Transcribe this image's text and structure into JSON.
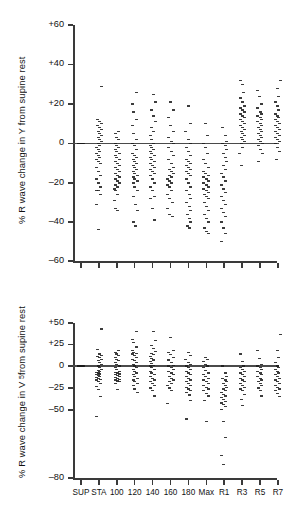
{
  "figure": {
    "title": "",
    "background": "#ffffff",
    "point_color": "#1a1a1a",
    "axis_color": "#3a3a3a"
  },
  "chart_data": [
    {
      "type": "scatter",
      "panel": "top",
      "title": "",
      "xlabel": "",
      "ylabel": "% R wave change in Y from supine rest",
      "ylabel_text": "% R wave change in Y from supine rest",
      "grid": false,
      "legend": "none",
      "ylim": [
        -60,
        60
      ],
      "yticks": [
        60,
        40,
        20,
        0,
        -20,
        -40,
        -60
      ],
      "ytick_labels": [
        "+60",
        "+40",
        "+20",
        "0",
        "–20",
        "–40",
        "–60"
      ],
      "categories": [
        "SUP",
        "STA",
        "100",
        "120",
        "140",
        "160",
        "180",
        "Max",
        "R1",
        "R3",
        "R5",
        "R7"
      ],
      "zero_reference_line": 0,
      "series": [
        {
          "name": "SUP",
          "values": [
            0,
            0,
            0,
            0,
            0,
            0,
            0,
            0,
            0,
            0,
            0,
            0,
            0,
            0,
            0,
            0,
            0,
            0,
            0,
            0,
            0,
            0,
            0,
            0,
            0,
            0,
            0,
            0,
            0,
            0
          ]
        },
        {
          "name": "STA",
          "values": [
            29,
            12,
            11,
            10,
            9,
            8,
            7,
            6,
            5,
            4,
            3,
            2,
            1,
            0,
            -1,
            -2,
            -3,
            -4,
            -5,
            -6,
            -7,
            -8,
            -9,
            -10,
            -12,
            -14,
            -16,
            -18,
            -20,
            -22,
            -24,
            -24,
            -26,
            -31,
            -44
          ]
        },
        {
          "name": "100",
          "values": [
            6,
            5,
            3,
            2,
            0,
            -1,
            -2,
            -3,
            -4,
            -5,
            -6,
            -7,
            -8,
            -9,
            -10,
            -11,
            -12,
            -13,
            -14,
            -15,
            -16,
            -17,
            -18,
            -19,
            -20,
            -21,
            -22,
            -23,
            -24,
            -26,
            -29,
            -33,
            -34
          ]
        },
        {
          "name": "120",
          "values": [
            26,
            20,
            16,
            12,
            9,
            5,
            2,
            0,
            -1,
            -3,
            -5,
            -6,
            -7,
            -8,
            -9,
            -10,
            -11,
            -12,
            -13,
            -14,
            -15,
            -16,
            -17,
            -18,
            -19,
            -20,
            -22,
            -24,
            -27,
            -31,
            -34,
            -40,
            -42
          ]
        },
        {
          "name": "140",
          "values": [
            25,
            21,
            17,
            14,
            11,
            8,
            6,
            4,
            2,
            0,
            -1,
            -2,
            -3,
            -4,
            -5,
            -6,
            -7,
            -8,
            -9,
            -10,
            -11,
            -12,
            -13,
            -14,
            -15,
            -16,
            -18,
            -20,
            -22,
            -24,
            -27,
            -28,
            -33,
            -39
          ]
        },
        {
          "name": "160",
          "values": [
            21,
            17,
            13,
            9,
            6,
            3,
            1,
            0,
            -2,
            -4,
            -6,
            -8,
            -10,
            -12,
            -13,
            -14,
            -15,
            -16,
            -17,
            -18,
            -19,
            -20,
            -21,
            -22,
            -24,
            -26,
            -28,
            -30,
            -33,
            -36,
            -37
          ]
        },
        {
          "name": "180",
          "values": [
            19,
            10,
            6,
            2,
            0,
            -2,
            -4,
            -6,
            -8,
            -9,
            -10,
            -11,
            -12,
            -13,
            -14,
            -15,
            -16,
            -18,
            -20,
            -22,
            -24,
            -26,
            -28,
            -30,
            -32,
            -34,
            -36,
            -38,
            -40,
            -42,
            -43
          ]
        },
        {
          "name": "Max",
          "values": [
            10,
            4,
            0,
            -2,
            -5,
            -8,
            -10,
            -12,
            -14,
            -15,
            -16,
            -17,
            -18,
            -19,
            -20,
            -21,
            -22,
            -23,
            -24,
            -25,
            -26,
            -27,
            -28,
            -30,
            -32,
            -34,
            -36,
            -38,
            -40,
            -43,
            -45,
            -46
          ]
        },
        {
          "name": "R1",
          "values": [
            8,
            4,
            1,
            0,
            -1,
            -3,
            -5,
            -7,
            -9,
            -11,
            -13,
            -15,
            -17,
            -19,
            -21,
            -23,
            -25,
            -27,
            -29,
            -31,
            -33,
            -35,
            -37,
            -40,
            -43,
            -46,
            -50
          ]
        },
        {
          "name": "R3",
          "values": [
            32,
            30,
            26,
            23,
            21,
            19,
            18,
            17,
            16,
            15,
            14,
            13,
            12,
            11,
            10,
            9,
            8,
            7,
            6,
            5,
            4,
            3,
            2,
            1,
            0,
            -2,
            -5,
            -11
          ]
        },
        {
          "name": "R5",
          "values": [
            27,
            24,
            20,
            18,
            16,
            15,
            14,
            13,
            12,
            11,
            10,
            9,
            8,
            7,
            6,
            5,
            4,
            3,
            2,
            1,
            0,
            -1,
            -3,
            -5,
            -9
          ]
        },
        {
          "name": "R7",
          "values": [
            32,
            28,
            24,
            21,
            19,
            17,
            15,
            14,
            13,
            12,
            11,
            10,
            9,
            8,
            7,
            6,
            5,
            4,
            3,
            2,
            1,
            0,
            -2,
            -4,
            -8
          ]
        }
      ]
    },
    {
      "type": "scatter",
      "panel": "bottom",
      "title": "",
      "xlabel": "",
      "ylabel": "% R wave change in V5 from supine rest",
      "ylabel_prefix": "% R wave change in V",
      "ylabel_subscript": "5",
      "ylabel_suffix": " from supine rest",
      "grid": false,
      "legend": "none",
      "ylim": [
        -80,
        50
      ],
      "yticks": [
        50,
        25,
        0,
        -25,
        -50,
        -80
      ],
      "ytick_labels": [
        "+50",
        "+25",
        "0",
        "–25",
        "–50",
        "–80"
      ],
      "categories": [
        "SUP",
        "STA",
        "100",
        "120",
        "140",
        "160",
        "180",
        "Max",
        "R1",
        "R3",
        "R5",
        "R7"
      ],
      "zero_reference_line": 0,
      "series": [
        {
          "name": "SUP",
          "values": [
            0,
            0,
            0,
            0,
            0,
            0,
            0,
            0,
            0,
            0,
            0,
            0,
            0,
            0,
            0,
            0,
            0,
            0,
            0,
            0,
            0,
            0,
            0,
            0,
            0,
            0,
            0,
            0,
            0,
            0
          ]
        },
        {
          "name": "STA",
          "values": [
            43,
            19,
            14,
            12,
            11,
            10,
            8,
            6,
            4,
            2,
            0,
            -2,
            -4,
            -5,
            -6,
            -7,
            -8,
            -9,
            -10,
            -11,
            -12,
            -13,
            -14,
            -15,
            -16,
            -18,
            -20,
            -23,
            -27,
            -35,
            -53
          ]
        },
        {
          "name": "100",
          "values": [
            18,
            16,
            14,
            12,
            10,
            8,
            6,
            4,
            2,
            0,
            -2,
            -4,
            -6,
            -7,
            -8,
            -9,
            -10,
            -11,
            -12,
            -13,
            -14,
            -15,
            -16,
            -17,
            -18,
            -20,
            -27
          ]
        },
        {
          "name": "120",
          "values": [
            40,
            31,
            27,
            22,
            18,
            16,
            15,
            14,
            12,
            10,
            8,
            6,
            4,
            2,
            0,
            -2,
            -4,
            -6,
            -8,
            -10,
            -12,
            -14,
            -16,
            -18,
            -20,
            -22,
            -26,
            -30
          ]
        },
        {
          "name": "140",
          "values": [
            40,
            30,
            24,
            20,
            17,
            15,
            13,
            11,
            9,
            7,
            5,
            3,
            1,
            0,
            -2,
            -4,
            -6,
            -8,
            -10,
            -12,
            -14,
            -16,
            -18,
            -20,
            -22,
            -25,
            -28,
            -34
          ]
        },
        {
          "name": "160",
          "values": [
            33,
            18,
            16,
            13,
            10,
            7,
            4,
            1,
            0,
            -2,
            -4,
            -6,
            -8,
            -10,
            -12,
            -14,
            -16,
            -18,
            -20,
            -22,
            -25,
            -28,
            -43
          ]
        },
        {
          "name": "180",
          "values": [
            16,
            12,
            8,
            4,
            2,
            0,
            -2,
            -4,
            -6,
            -8,
            -10,
            -12,
            -14,
            -16,
            -18,
            -20,
            -22,
            -24,
            -26,
            -28,
            -30,
            -33,
            -39,
            -54
          ]
        },
        {
          "name": "Max",
          "values": [
            10,
            8,
            5,
            2,
            0,
            -2,
            -5,
            -8,
            -10,
            -12,
            -14,
            -16,
            -18,
            -20,
            -22,
            -24,
            -26,
            -28,
            -31,
            -34,
            -39,
            -55
          ]
        },
        {
          "name": "R1",
          "values": [
            0,
            -8,
            -12,
            -14,
            -16,
            -18,
            -20,
            -22,
            -24,
            -26,
            -28,
            -30,
            -32,
            -34,
            -36,
            -38,
            -40,
            -42,
            -44,
            -46,
            -49,
            -55,
            -62,
            -70,
            -74
          ]
        },
        {
          "name": "R3",
          "values": [
            14,
            5,
            0,
            -2,
            -4,
            -6,
            -8,
            -10,
            -12,
            -14,
            -16,
            -18,
            -20,
            -22,
            -24,
            -26,
            -28,
            -32,
            -38,
            -45
          ]
        },
        {
          "name": "R5",
          "values": [
            18,
            9,
            2,
            0,
            -2,
            -4,
            -6,
            -8,
            -10,
            -12,
            -14,
            -16,
            -18,
            -20,
            -22,
            -25,
            -28,
            -34
          ]
        },
        {
          "name": "R7",
          "values": [
            37,
            18,
            10,
            4,
            0,
            -2,
            -4,
            -6,
            -8,
            -10,
            -12,
            -14,
            -16,
            -18,
            -20,
            -22,
            -24,
            -26,
            -28,
            -31,
            -35
          ]
        }
      ]
    }
  ]
}
